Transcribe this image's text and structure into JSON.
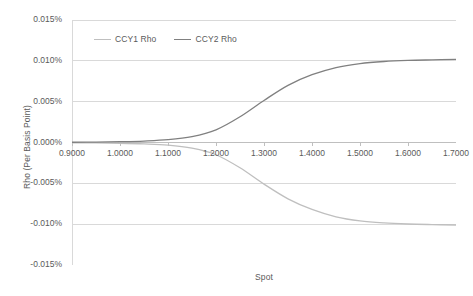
{
  "chart_data": {
    "type": "line",
    "title": "",
    "xlabel": "Spot",
    "ylabel": "Rho (Per Basis Point)",
    "xlim": [
      0.9,
      1.7
    ],
    "ylim": [
      -0.015,
      0.015
    ],
    "xtick_labels": [
      "0.9000",
      "1.0000",
      "1.1000",
      "1.2000",
      "1.3000",
      "1.4000",
      "1.5000",
      "1.6000",
      "1.7000"
    ],
    "xticks": [
      0.9,
      1.0,
      1.1,
      1.2,
      1.3,
      1.4,
      1.5,
      1.6,
      1.7
    ],
    "ytick_labels": [
      "0.015%",
      "0.010%",
      "0.005%",
      "0.000%",
      "-0.005%",
      "-0.010%",
      "-0.015%"
    ],
    "yticks": [
      0.015,
      0.01,
      0.005,
      0.0,
      -0.005,
      -0.01,
      -0.015
    ],
    "y_unit": "%",
    "grid": true,
    "legend_position": "top-inside",
    "series": [
      {
        "name": "CCY1 Rho",
        "color": "#bfbfbf",
        "x": [
          0.9,
          0.95,
          1.0,
          1.05,
          1.1,
          1.15,
          1.2,
          1.25,
          1.3,
          1.35,
          1.4,
          1.45,
          1.5,
          1.55,
          1.6,
          1.65,
          1.7
        ],
        "values": [
          -3e-05,
          -5e-05,
          -9e-05,
          -0.00017,
          -0.00032,
          -0.0007,
          -0.0015,
          -0.0031,
          -0.0051,
          -0.0069,
          -0.0082,
          -0.0091,
          -0.0096,
          -0.00985,
          -0.00998,
          -0.01005,
          -0.0101
        ]
      },
      {
        "name": "CCY2 Rho",
        "color": "#808080",
        "x": [
          0.9,
          0.95,
          1.0,
          1.05,
          1.1,
          1.15,
          1.2,
          1.25,
          1.3,
          1.35,
          1.4,
          1.45,
          1.5,
          1.55,
          1.6,
          1.65,
          1.7
        ],
        "values": [
          3e-05,
          5e-05,
          0.0001,
          0.00018,
          0.00034,
          0.00072,
          0.00155,
          0.00315,
          0.00515,
          0.007,
          0.0083,
          0.00918,
          0.00967,
          0.00992,
          0.01005,
          0.01012,
          0.01018
        ]
      }
    ]
  },
  "legend": {
    "items": [
      {
        "label": "CCY1 Rho",
        "color": "#bfbfbf"
      },
      {
        "label": "CCY2 Rho",
        "color": "#808080"
      }
    ]
  },
  "axes": {
    "x_title": "Spot",
    "y_title": "Rho (Per Basis Point)"
  }
}
